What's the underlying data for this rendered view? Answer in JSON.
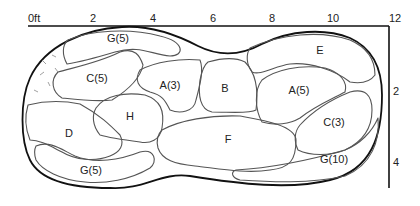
{
  "diagram": {
    "type": "planting-bed-plan",
    "scale_unit": "ft",
    "x_axis": {
      "ticks": [
        "0ft",
        "2",
        "4",
        "6",
        "8",
        "10",
        "12"
      ]
    },
    "y_axis": {
      "ticks": [
        "2",
        "4"
      ]
    },
    "regions": [
      {
        "id": "g5-top",
        "label": "G(5)"
      },
      {
        "id": "c5",
        "label": "C(5)"
      },
      {
        "id": "a3",
        "label": "A(3)"
      },
      {
        "id": "b",
        "label": "B"
      },
      {
        "id": "e",
        "label": "E"
      },
      {
        "id": "a5",
        "label": "A(5)"
      },
      {
        "id": "h",
        "label": "H"
      },
      {
        "id": "d",
        "label": "D"
      },
      {
        "id": "f",
        "label": "F"
      },
      {
        "id": "c3",
        "label": "C(3)"
      },
      {
        "id": "g5-bottom",
        "label": "G(5)"
      },
      {
        "id": "g10",
        "label": "G(10)"
      }
    ],
    "colors": {
      "outline": "#111111",
      "region_line": "#555555",
      "background": "#ffffff"
    }
  }
}
